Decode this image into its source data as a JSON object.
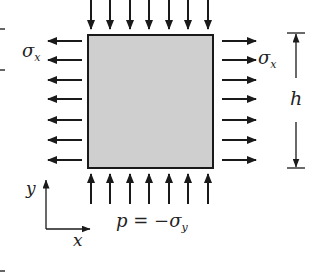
{
  "diagram": {
    "title": "",
    "colors": {
      "plate_fill": "#cfcfcf",
      "plate_border": "#1a1a1a",
      "arrow": "#1a1a1a",
      "text": "#222222",
      "background": "#ffffff"
    },
    "plate": {
      "x": 88,
      "y": 35,
      "width": 125,
      "height": 133
    },
    "labels": {
      "sigma_x_left": {
        "base": "σ",
        "sub": "x"
      },
      "sigma_x_right": {
        "base": "σ",
        "sub": "x"
      },
      "height": "h",
      "pressure": {
        "lhs": "p = −σ",
        "sub": "y"
      },
      "axis_x": "x",
      "axis_y": "y"
    },
    "arrows": {
      "top": {
        "count": 7,
        "direction": "down",
        "xs": [
          91,
          110,
          130,
          149,
          169,
          188,
          208
        ],
        "y_start": 0,
        "y_end": 29
      },
      "bottom": {
        "count": 7,
        "direction": "up",
        "xs": [
          91,
          110,
          130,
          149,
          169,
          188,
          208
        ],
        "y_start": 204,
        "y_end": 174
      },
      "left": {
        "count": 7,
        "direction": "left",
        "ys": [
          41,
          60,
          80,
          99,
          120,
          140,
          160
        ],
        "x_start": 82,
        "x_end": 48
      },
      "right": {
        "count": 7,
        "direction": "right",
        "ys": [
          41,
          60,
          80,
          99,
          120,
          140,
          160
        ],
        "x_start": 222,
        "x_end": 256
      }
    },
    "dimension_h": {
      "x": 296,
      "y_top": 33,
      "y_bottom": 168,
      "gap_top": 78,
      "gap_bottom": 122
    },
    "axes": {
      "origin_x": 46,
      "origin_y": 229,
      "x_end": 90,
      "y_end": 180
    }
  }
}
